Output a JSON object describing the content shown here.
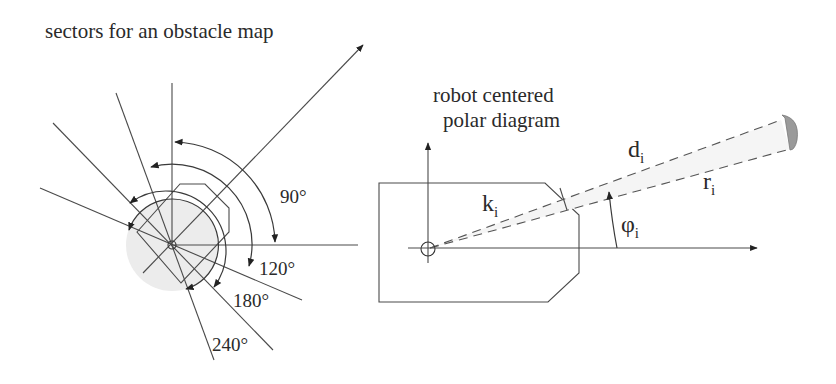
{
  "left_panel": {
    "title": "sectors for an obstacle map",
    "sector_labels": [
      {
        "id": "s90",
        "text": "90°"
      },
      {
        "id": "s120",
        "text": "120°"
      },
      {
        "id": "s180",
        "text": "180°"
      },
      {
        "id": "s240",
        "text": "240°"
      }
    ]
  },
  "right_panel": {
    "title_line1": "robot centered",
    "title_line2": "polar diagram",
    "labels": {
      "d": {
        "base": "d",
        "sub": "i"
      },
      "r": {
        "base": "r",
        "sub": "i"
      },
      "k": {
        "base": "k",
        "sub": "i"
      },
      "phi": {
        "base": "φ",
        "sub": "i"
      }
    }
  },
  "colors": {
    "line": "#4a4a4a",
    "shade": "#ececec",
    "cap": "#9a9a9a",
    "text": "#2a2a2a"
  }
}
